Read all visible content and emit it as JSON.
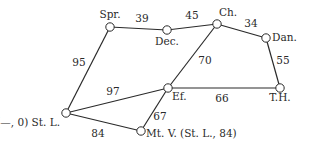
{
  "graph": {
    "nodes": [
      {
        "id": "spr",
        "label": "Spr.",
        "x": 110,
        "y": 27,
        "lx": 110,
        "ly": 18,
        "anchor": "middle"
      },
      {
        "id": "dec",
        "label": "Dec.",
        "x": 167,
        "y": 30,
        "lx": 167,
        "ly": 45,
        "anchor": "middle"
      },
      {
        "id": "ch",
        "label": "Ch.",
        "x": 217,
        "y": 24,
        "lx": 219,
        "ly": 16,
        "anchor": "start"
      },
      {
        "id": "dan",
        "label": "Dan.",
        "x": 266,
        "y": 38,
        "lx": 272,
        "ly": 38,
        "anchor": "start"
      },
      {
        "id": "ef",
        "label": "Ef.",
        "x": 168,
        "y": 88,
        "lx": 172,
        "ly": 100,
        "anchor": "start"
      },
      {
        "id": "th",
        "label": "T.H.",
        "x": 280,
        "y": 88,
        "lx": 280,
        "ly": 101,
        "anchor": "middle"
      },
      {
        "id": "stl",
        "label": "(—, 0) St. L.",
        "x": 66,
        "y": 113,
        "lx": 60,
        "ly": 126,
        "anchor": "end"
      },
      {
        "id": "mtv",
        "label": "Mt. V. (St. L., 84)",
        "x": 141,
        "y": 131,
        "lx": 146,
        "ly": 134,
        "anchor": "start"
      }
    ],
    "edges": [
      {
        "from": "spr",
        "to": "dec",
        "weight": "39",
        "lx": 142,
        "ly": 22
      },
      {
        "from": "dec",
        "to": "ch",
        "weight": "45",
        "lx": 192,
        "ly": 19
      },
      {
        "from": "ch",
        "to": "dan",
        "weight": "34",
        "lx": 251,
        "ly": 27
      },
      {
        "from": "spr",
        "to": "stl",
        "weight": "95",
        "lx": 79,
        "ly": 66
      },
      {
        "from": "ch",
        "to": "ef",
        "weight": "70",
        "lx": 205,
        "ly": 64
      },
      {
        "from": "dan",
        "to": "th",
        "weight": "55",
        "lx": 283,
        "ly": 64
      },
      {
        "from": "stl",
        "to": "ef",
        "weight": "97",
        "lx": 113,
        "ly": 95
      },
      {
        "from": "ef",
        "to": "th",
        "weight": "66",
        "lx": 222,
        "ly": 102
      },
      {
        "from": "stl",
        "to": "mtv",
        "weight": "84",
        "lx": 98,
        "ly": 137
      },
      {
        "from": "ef",
        "to": "mtv",
        "weight": "67",
        "lx": 160,
        "ly": 120
      }
    ]
  }
}
